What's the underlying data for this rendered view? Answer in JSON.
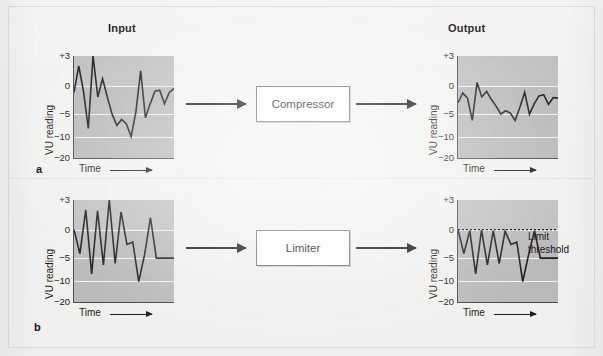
{
  "figure": {
    "background_color": "#f1f1ef",
    "plot_fill_color": "#b9b9b9",
    "line_color": "#1c1c1c",
    "gridline_color": "#f2f2f2"
  },
  "headers": {
    "input": "Input",
    "output": "Output"
  },
  "panels": [
    {
      "letter": "a",
      "processor": "Compressor"
    },
    {
      "letter": "b",
      "processor": "Limiter"
    }
  ],
  "axis": {
    "y_label": "VU reading",
    "x_label": "Time",
    "y_ticks": [
      "+3",
      "0",
      "−5",
      "−10",
      "−20"
    ],
    "y_tick_values": [
      3,
      0,
      -5,
      -10,
      -20
    ],
    "y_tick_positions_pct": [
      0,
      29,
      57,
      79,
      100
    ],
    "x_arrow": "arrow-right"
  },
  "annotations": {
    "limit_threshold_line1": "Limit",
    "limit_threshold_line2": "threshold",
    "limit_threshold_value": 0
  },
  "chart_data": [
    {
      "id": "a-input",
      "type": "line",
      "title": "Input",
      "panel": "a",
      "xlabel": "Time",
      "ylabel": "VU reading",
      "ylim": [
        -20,
        3
      ],
      "yticks": [
        3,
        0,
        -5,
        -10,
        -20
      ],
      "grid": true,
      "legend": "none",
      "x": [
        0,
        1,
        2,
        3,
        4,
        5,
        6,
        7,
        8,
        9,
        10,
        11,
        12,
        13,
        14,
        15,
        16,
        17,
        18,
        19,
        20,
        21
      ],
      "values": [
        -1.2,
        2.0,
        -1.0,
        -8.2,
        3.0,
        -2.0,
        0.7,
        -2.0,
        -5.0,
        -7.5,
        -6.2,
        -7.2,
        -10.0,
        -4.6,
        1.5,
        -5.8,
        -3.2,
        -1.0,
        -0.8,
        -3.2,
        -1.2,
        -0.5
      ]
    },
    {
      "id": "a-output",
      "type": "line",
      "title": "Output",
      "panel": "a",
      "xlabel": "Time",
      "ylabel": "VU reading",
      "ylim": [
        -20,
        3
      ],
      "yticks": [
        3,
        0,
        -5,
        -10,
        -20
      ],
      "grid": true,
      "legend": "none",
      "x": [
        0,
        1,
        2,
        3,
        4,
        5,
        6,
        7,
        8,
        9,
        10,
        11,
        12,
        13,
        14,
        15,
        16,
        17,
        18,
        19,
        20,
        21
      ],
      "values": [
        -3.0,
        -1.3,
        -2.2,
        -6.4,
        0.3,
        -2.0,
        -1.0,
        -2.4,
        -3.6,
        -5.0,
        -4.4,
        -4.8,
        -6.4,
        -3.8,
        -1.2,
        -5.0,
        -3.2,
        -1.8,
        -1.6,
        -3.3,
        -2.1,
        -2.2
      ]
    },
    {
      "id": "b-input",
      "type": "line",
      "title": "Input",
      "panel": "b",
      "xlabel": "Time",
      "ylabel": "VU reading",
      "ylim": [
        -20,
        3
      ],
      "yticks": [
        3,
        0,
        -5,
        -10,
        -20
      ],
      "grid": true,
      "legend": "none",
      "x": [
        0,
        1,
        2,
        3,
        4,
        5,
        6,
        7,
        8,
        9,
        10,
        11,
        12,
        13,
        14,
        15,
        16,
        17
      ],
      "values": [
        0.0,
        -4.2,
        2.0,
        -8.5,
        1.9,
        -6.5,
        3.0,
        -6.2,
        1.8,
        -2.6,
        -2.2,
        -10.5,
        -4.4,
        1.2,
        -5.0,
        -5.0,
        -5.0,
        -5.0
      ]
    },
    {
      "id": "b-output",
      "type": "line",
      "title": "Output",
      "panel": "b",
      "xlabel": "Time",
      "ylabel": "VU reading",
      "ylim": [
        -20,
        3
      ],
      "yticks": [
        3,
        0,
        -5,
        -10,
        -20
      ],
      "grid": true,
      "legend": "none",
      "threshold": 0,
      "threshold_label": "Limit threshold",
      "x": [
        0,
        1,
        2,
        3,
        4,
        5,
        6,
        7,
        8,
        9,
        10,
        11,
        12,
        13,
        14,
        15,
        16,
        17
      ],
      "values": [
        0.0,
        -4.2,
        -0.2,
        -8.5,
        -0.1,
        -6.5,
        -0.2,
        -6.2,
        -0.3,
        -2.6,
        -2.2,
        -10.5,
        -4.4,
        -0.2,
        -5.0,
        -5.0,
        -5.0,
        -5.0
      ]
    }
  ]
}
